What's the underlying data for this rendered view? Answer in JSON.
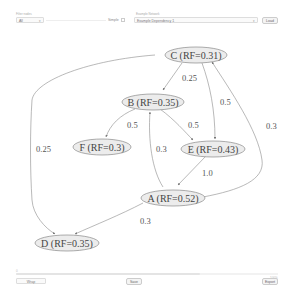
{
  "toolbar": {
    "filter_label": "Filter nodes",
    "filter_select": {
      "value": "All",
      "caret": "▾"
    },
    "simple_label": "Simple",
    "simple_checked": false,
    "network_label": "Example Network",
    "network_select": {
      "value": "Example Dependency 1",
      "caret": "▾"
    },
    "load_button": "Load"
  },
  "graph": {
    "node_shape": "ellipse",
    "nodes": [
      {
        "id": "C",
        "label": "C (RF=0.31)"
      },
      {
        "id": "B",
        "label": "B (RF=0.35)"
      },
      {
        "id": "F",
        "label": "F (RF=0.3)"
      },
      {
        "id": "E",
        "label": "E (RF=0.43)"
      },
      {
        "id": "A",
        "label": "A (RF=0.52)"
      },
      {
        "id": "D",
        "label": "D (RF=0.35)"
      }
    ],
    "edges": [
      {
        "from": "C",
        "to": "B",
        "label": "0.25"
      },
      {
        "from": "C",
        "to": "E",
        "label": "0.5"
      },
      {
        "from": "C",
        "to": "D",
        "label": "0.25"
      },
      {
        "from": "B",
        "to": "F",
        "label": "0.5"
      },
      {
        "from": "B",
        "to": "E",
        "label": "0.5"
      },
      {
        "from": "A",
        "to": "B",
        "label": "0.3"
      },
      {
        "from": "E",
        "to": "A",
        "label": "1.0"
      },
      {
        "from": "A",
        "to": "C",
        "label": "0.3"
      },
      {
        "from": "A",
        "to": "D",
        "label": "0.3"
      }
    ],
    "colors": {
      "node_fill": "#ececec",
      "node_stroke": "#8a8a8a",
      "edge": "#8a8a8a",
      "text": "#444444"
    }
  },
  "bottombar": {
    "status_left": "0",
    "status_right": "100%",
    "wrap_select": {
      "value": "Wrap",
      "caret": "▾"
    },
    "save_button": "Save",
    "export_button": "Export"
  }
}
